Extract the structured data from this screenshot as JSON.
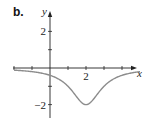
{
  "panel_label": "b.",
  "chart_data": {
    "type": "line",
    "title": "",
    "xlabel": "x",
    "ylabel": "y",
    "function_hint": "y = -2 / (1 + (x - 2)^2)",
    "x_ticks": [
      -2,
      -1,
      0,
      1,
      2,
      3,
      4
    ],
    "x_tick_labels": [
      {
        "value": 2,
        "label": "2"
      }
    ],
    "y_ticks": [
      -2,
      -1,
      1,
      2
    ],
    "y_tick_labels": [
      {
        "value": 2,
        "label": "2"
      },
      {
        "value": -2,
        "label": "−2"
      }
    ],
    "xlim": [
      -2,
      5
    ],
    "ylim": [
      -2.7,
      3.1
    ],
    "grid": false,
    "legend": null,
    "series": [
      {
        "name": "curve",
        "color": "#8c8c8c",
        "x": [
          -2,
          -1,
          0,
          0.5,
          1,
          1.5,
          2,
          2.5,
          3,
          3.5,
          4,
          5
        ],
        "y": [
          -0.12,
          -0.2,
          -0.4,
          -0.62,
          -1.0,
          -1.6,
          -2.0,
          -1.6,
          -1.0,
          -0.62,
          -0.4,
          -0.2
        ]
      }
    ],
    "minimum": {
      "x": 2,
      "y": -2
    }
  },
  "colors": {
    "axis": "#222222",
    "curve": "#8c8c8c"
  }
}
